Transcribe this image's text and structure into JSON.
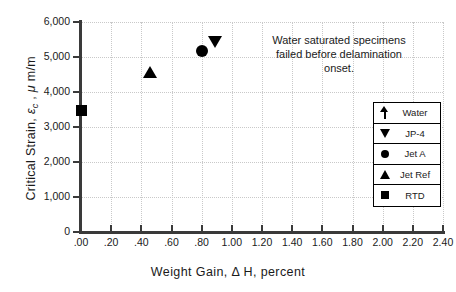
{
  "chart_data": {
    "type": "scatter",
    "title": "",
    "xlabel": "Weight Gain,  Δ H,  percent",
    "ylabel": "Critical Strain,  εc ,  μ m/m",
    "ylabel_parts": {
      "pre": "Critical Strain, ",
      "eps": "ε",
      "sub": "c",
      "post": " ,  μ m/m"
    },
    "xlim": [
      0.0,
      2.4
    ],
    "ylim": [
      0,
      6000
    ],
    "xticks": [
      0.0,
      0.2,
      0.4,
      0.6,
      0.8,
      1.0,
      1.2,
      1.4,
      1.6,
      1.8,
      2.0,
      2.2,
      2.4
    ],
    "xtick_labels": [
      ".00",
      ".20",
      ".40",
      ".60",
      ".80",
      "1.00",
      "1.20",
      "1.40",
      "1.60",
      "1.80",
      "2.00",
      "2.20",
      "2.40"
    ],
    "yticks": [
      0,
      1000,
      2000,
      3000,
      4000,
      5000,
      6000
    ],
    "ytick_labels": [
      "0",
      "1,000",
      "2,000",
      "3,000",
      "4,000",
      "5,000",
      "6,000"
    ],
    "grid": true,
    "grid_color": "#c9c9c9",
    "legend_position": "lower-right",
    "marker_color": "#000000",
    "series": [
      {
        "name": "Water",
        "marker": "arrow-up",
        "points": []
      },
      {
        "name": "JP-4",
        "marker": "triangle-down",
        "points": [
          {
            "x": 0.89,
            "y": 5430
          }
        ]
      },
      {
        "name": "Jet A",
        "marker": "circle",
        "points": [
          {
            "x": 0.8,
            "y": 5180
          }
        ]
      },
      {
        "name": "Jet Ref",
        "marker": "triangle-up",
        "points": [
          {
            "x": 0.46,
            "y": 4580
          }
        ]
      },
      {
        "name": "RTD",
        "marker": "square",
        "points": [
          {
            "x": 0.0,
            "y": 3480
          }
        ]
      }
    ],
    "annotations": [
      {
        "lines": [
          "Water saturated specimens",
          "failed before delamination",
          "onset."
        ]
      }
    ]
  },
  "legend": {
    "items": [
      {
        "label": "Water",
        "marker": "arrow-up"
      },
      {
        "label": "JP-4",
        "marker": "triangle-down"
      },
      {
        "label": "Jet A",
        "marker": "circle"
      },
      {
        "label": "Jet Ref",
        "marker": "triangle-up"
      },
      {
        "label": "RTD",
        "marker": "square"
      }
    ]
  }
}
